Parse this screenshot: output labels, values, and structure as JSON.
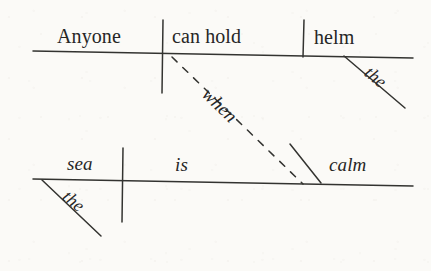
{
  "diagram": {
    "type": "reed-kellogg-sentence-diagram",
    "sentence": "Anyone can hold the helm when the sea is calm.",
    "ink_color": "#262626",
    "paper_color": "#fbfaf7",
    "main_clause": {
      "subject": {
        "text": "Anyone",
        "style": "upright",
        "role": "subject"
      },
      "verb": {
        "text": "can hold",
        "style": "upright",
        "role": "verb"
      },
      "direct_object": {
        "text": "helm",
        "style": "upright",
        "role": "direct-object"
      },
      "object_modifier": {
        "text": "the",
        "style": "italic",
        "role": "article-modifier"
      }
    },
    "subordinate_clause": {
      "subject": {
        "text": "sea",
        "style": "italic",
        "role": "subject"
      },
      "subject_modifier": {
        "text": "the",
        "style": "italic",
        "role": "article-modifier"
      },
      "verb": {
        "text": "is",
        "style": "italic",
        "role": "linking-verb"
      },
      "predicate_adjective": {
        "text": "calm",
        "style": "italic",
        "role": "predicate-adjective"
      }
    },
    "connector": {
      "text": "when",
      "style": "italic",
      "role": "subordinating-conjunction",
      "line_style": "dashed"
    }
  }
}
